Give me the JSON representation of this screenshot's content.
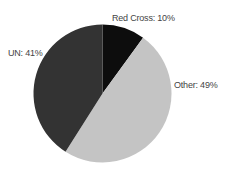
{
  "chart_data": {
    "type": "pie",
    "title": "",
    "start_angle_deg": 0,
    "direction": "clockwise",
    "categories": [
      "Red Cross",
      "Other",
      "UN"
    ],
    "values": [
      10,
      49,
      41
    ],
    "unit": "%",
    "colors": [
      "#0d0d0d",
      "#c4c4c4",
      "#333333"
    ],
    "labels": [
      "Red Cross: 10%",
      "Other: 49%",
      "UN: 41%"
    ],
    "legend": "none",
    "grid": false
  },
  "slices": [
    {
      "name": "Red Cross",
      "value": 10,
      "color": "#0d0d0d",
      "label": "Red Cross: 10%"
    },
    {
      "name": "Other",
      "value": 49,
      "color": "#c4c4c4",
      "label": "Other: 49%"
    },
    {
      "name": "UN",
      "value": 41,
      "color": "#333333",
      "label": "UN: 41%"
    }
  ]
}
